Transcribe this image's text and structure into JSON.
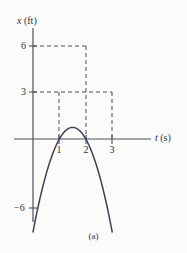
{
  "chart_data": {
    "type": "line",
    "title": "",
    "caption": "(a)",
    "xlabel": "t (s)",
    "xlabel_var": "t",
    "xlabel_unit": "(s)",
    "ylabel": "x (ft)",
    "ylabel_var": "x",
    "ylabel_unit": "(ft)",
    "xlim": [
      -0.25,
      4.4
    ],
    "ylim": [
      -7.2,
      7.6
    ],
    "grid": false,
    "legend": null,
    "x_ticks": [
      1,
      2,
      3
    ],
    "x_tick_labels": [
      "1",
      "2",
      "3"
    ],
    "y_ticks": [
      6,
      3,
      -6
    ],
    "y_tick_labels": [
      "6",
      "3",
      "−6"
    ],
    "series": [
      {
        "name": "x(t)",
        "equation": "x = -6 + 9t - 3t^2",
        "color": "#3a4152",
        "x": [
          0.0,
          0.2,
          0.4,
          0.55,
          0.6,
          0.8,
          1.0,
          1.2,
          1.4,
          1.6,
          1.8,
          2.0,
          2.2,
          2.4,
          2.6,
          2.8,
          3.0
        ],
        "values": [
          -6.0,
          -4.32,
          -2.88,
          -1.96,
          -1.68,
          -0.72,
          0.0,
          0.48,
          0.72,
          0.72,
          0.48,
          0.0,
          -0.72,
          -1.68,
          -2.88,
          -4.32,
          -6.0
        ]
      }
    ],
    "curve_points": [
      {
        "t": 0.0,
        "x": -6.0
      },
      {
        "t": 1.0,
        "x": 3.0
      },
      {
        "t": 2.0,
        "x": 6.0
      },
      {
        "t": 3.0,
        "x": 3.0
      }
    ],
    "zero_crossing": 0.55,
    "annotations": [
      {
        "type": "dashed-horizontal",
        "y": 6,
        "from_x": 0,
        "to_x": 2
      },
      {
        "type": "dashed-horizontal",
        "y": 3,
        "from_x": 0,
        "to_x": 3
      },
      {
        "type": "dashed-vertical",
        "x": 1,
        "from_y": 0,
        "to_y": 3
      },
      {
        "type": "dashed-vertical",
        "x": 2,
        "from_y": 0,
        "to_y": 6
      },
      {
        "type": "dashed-vertical",
        "x": 3,
        "from_y": 0,
        "to_y": 3
      }
    ],
    "colors": {
      "curve": "#3a4152",
      "axis": "#4a5161",
      "dashed": "#4a5161",
      "background": "#fbfbf9",
      "text": "#2e3442"
    }
  }
}
